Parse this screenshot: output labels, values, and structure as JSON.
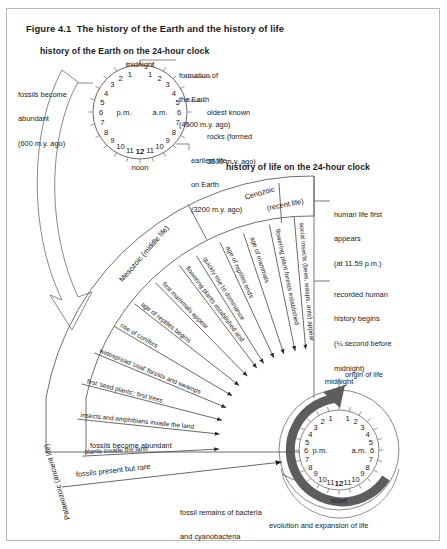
{
  "figure": {
    "number": "Figure 4.1",
    "title": "The history of the Earth and the history of life"
  },
  "sections": {
    "top_heading": "history of the Earth on the 24-hour clock",
    "bottom_heading": "history of life on the 24-hour clock"
  },
  "top_clock": {
    "name": "earth-history-clock",
    "top_label": "midnight",
    "bottom_label": "noon",
    "left_inner_label": "p.m.",
    "right_inner_label": "a.m.",
    "am_numbers": [
      "1",
      "2",
      "3",
      "4",
      "5",
      "6",
      "7",
      "8",
      "9",
      "10",
      "11",
      "12"
    ],
    "pm_numbers": [
      "1",
      "2",
      "3",
      "4",
      "5",
      "6",
      "7",
      "8",
      "9",
      "10",
      "11",
      "12"
    ],
    "callouts": [
      {
        "id": "fossils-abundant",
        "lines": [
          "fossils become",
          "abundant",
          "(600 m.y. ago)"
        ]
      },
      {
        "id": "formation-earth",
        "lines": [
          "formation of",
          "the Earth",
          "(4500 m.y. ago)"
        ]
      },
      {
        "id": "oldest-rocks",
        "lines": [
          "oldest known",
          "rocks (formed",
          "3500 m.y. ago)"
        ]
      },
      {
        "id": "earliest-life",
        "lines": [
          "earliest life",
          "on Earth",
          "(3200 m.y. ago)"
        ]
      }
    ]
  },
  "bottom_clock": {
    "name": "life-history-clock",
    "top_label": "midnight",
    "bottom_label": "noon",
    "left_inner_label": "p.m.",
    "right_inner_label": "a.m.",
    "am_numbers": [
      "1",
      "2",
      "3",
      "4",
      "5",
      "6",
      "7",
      "8",
      "9",
      "10",
      "11",
      "12"
    ],
    "pm_numbers": [
      "1",
      "2",
      "3",
      "4",
      "5",
      "6",
      "7",
      "8",
      "9",
      "10",
      "11",
      "12"
    ],
    "origin_label": "origin of life",
    "arc_caption": "evolution and expansion of life"
  },
  "eras": [
    {
      "id": "palaeozoic",
      "label": "Palaeozoic (ancient life)"
    },
    {
      "id": "mesozoic",
      "label": "Mesozoic (middle life)"
    },
    {
      "id": "cenozoic",
      "label": "Cenozoic"
    },
    {
      "id": "cenozoic2",
      "label": "(recent life)"
    }
  ],
  "events": [
    {
      "id": "plants-invade",
      "label": "plants invade the land"
    },
    {
      "id": "insects-amphibians",
      "label": "insects and amphibians invade the land"
    },
    {
      "id": "seed-plants",
      "label": "first 'seed plants'; first trees"
    },
    {
      "id": "coal-forests",
      "label": "widespread 'coal' forests and swamps"
    },
    {
      "id": "conifers",
      "label": "rise of conifers"
    },
    {
      "id": "reptiles-begin",
      "label": "age of reptiles begins"
    },
    {
      "id": "first-mammals",
      "label": "first mammals appear"
    },
    {
      "id": "flowering-dominance",
      "label": "flowering plants established and"
    },
    {
      "id": "flowering-dominance2",
      "label": "quickly rise to dominance"
    },
    {
      "id": "reptiles-end",
      "label": "age of reptiles ends"
    },
    {
      "id": "mammals-age",
      "label": "age of mammals"
    },
    {
      "id": "flowering-forests",
      "label": "flowering plant forests established"
    },
    {
      "id": "social-insects",
      "label": "social insects (bees, wasps, ants) appear"
    }
  ],
  "right_callouts": [
    {
      "id": "human-life",
      "lines": [
        "human life first",
        "appears",
        "(at 11.59 p.m.)"
      ]
    },
    {
      "id": "recorded-history",
      "lines": [
        "recorded human",
        "history begins",
        "(¼ second before",
        "midnight)"
      ]
    }
  ],
  "bottom_callouts": [
    {
      "id": "fossils-abundant-2",
      "label": "fossils become abundant"
    },
    {
      "id": "fossils-rare",
      "label": "fossils present but rare"
    },
    {
      "id": "fossil-bacteria",
      "lines": [
        "fossil remains of bacteria",
        "and cyanobacteria"
      ]
    }
  ],
  "colors": {
    "ink": "#1a1a1a",
    "line": "#4a4a4a",
    "arc_gray": "#5a5a5a",
    "frame": "#b9b9b9"
  }
}
